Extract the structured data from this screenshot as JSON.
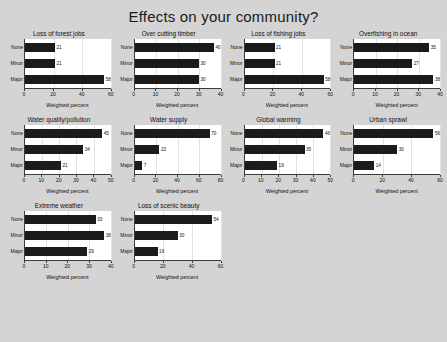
{
  "chart_data": {
    "type": "bar",
    "title": "Effects on your community?",
    "xlabel": "Weighted percent",
    "ylabel": "",
    "categories": [
      "None",
      "Minor",
      "Major"
    ],
    "orientation": "horizontal",
    "grid": true,
    "legend": "none",
    "panels": [
      {
        "title": "Loss of forest jobs",
        "values": [
          21,
          21,
          58
        ],
        "xlim": [
          0,
          60
        ],
        "xticks": [
          0,
          20,
          40,
          60
        ]
      },
      {
        "title": "Over cutting timber",
        "values": [
          40,
          30,
          30
        ],
        "xlim": [
          0,
          40
        ],
        "xticks": [
          0,
          10,
          20,
          30,
          40
        ]
      },
      {
        "title": "Loss of fishing jobs",
        "values": [
          21,
          21,
          58
        ],
        "xlim": [
          0,
          60
        ],
        "xticks": [
          0,
          20,
          40,
          60
        ]
      },
      {
        "title": "Overfishing in ocean",
        "values": [
          35,
          27,
          38
        ],
        "xlim": [
          0,
          40
        ],
        "xticks": [
          0,
          10,
          20,
          30,
          40
        ]
      },
      {
        "title": "Water quality/pollution",
        "values": [
          45,
          34,
          21
        ],
        "xlim": [
          0,
          50
        ],
        "xticks": [
          0,
          10,
          20,
          30,
          40,
          50
        ]
      },
      {
        "title": "Water supply",
        "values": [
          70,
          23,
          7
        ],
        "xlim": [
          0,
          80
        ],
        "xticks": [
          0,
          20,
          40,
          60,
          80
        ]
      },
      {
        "title": "Global warming",
        "values": [
          46,
          35,
          19
        ],
        "xlim": [
          0,
          50
        ],
        "xticks": [
          0,
          10,
          20,
          30,
          40,
          50
        ]
      },
      {
        "title": "Urban sprawl",
        "values": [
          56,
          30,
          14
        ],
        "xlim": [
          0,
          60
        ],
        "xticks": [
          0,
          20,
          40,
          60
        ]
      },
      {
        "title": "Extreme weather",
        "values": [
          33,
          38,
          29
        ],
        "xlim": [
          0,
          40
        ],
        "xticks": [
          0,
          10,
          20,
          30,
          40
        ]
      },
      {
        "title": "Loss of scenic beauty",
        "values": [
          54,
          30,
          16
        ],
        "xlim": [
          0,
          60
        ],
        "xticks": [
          0,
          20,
          40,
          60
        ]
      }
    ]
  },
  "colors": {
    "background": "#d4d4d4",
    "plot_background": "#ffffff",
    "bar": "#1b1b1b",
    "axis": "#3b3b3b",
    "gridline": "#e2e2e2",
    "text": "#111111"
  }
}
